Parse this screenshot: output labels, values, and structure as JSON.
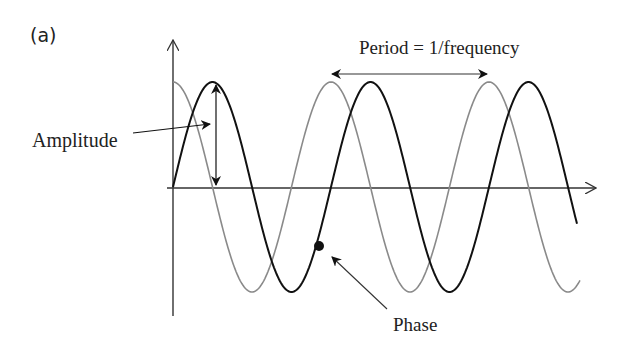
{
  "figure": {
    "panel_label": "(a)",
    "labels": {
      "amplitude": "Amplitude",
      "period": "Period = 1/frequency",
      "phase": "Phase"
    },
    "colors": {
      "wave_primary": "#111111",
      "wave_shifted": "#8a8a8a",
      "axes": "#333333",
      "background": "#ffffff"
    },
    "waves": [
      {
        "name": "primary-wave",
        "shape": "sine",
        "color": "#111111",
        "cycles_shown": 2.55
      },
      {
        "name": "shifted-wave",
        "shape": "cosine (phase-shifted)",
        "color": "#8a8a8a",
        "cycles_shown": 2.58
      }
    ],
    "annotations": [
      {
        "name": "amplitude-arrow",
        "description": "double-headed vertical arrow from axis to peak"
      },
      {
        "name": "period-arrow",
        "description": "double-headed horizontal arrow spanning one cycle of shifted wave"
      },
      {
        "name": "phase-marker",
        "description": "dot on primary wave with arrow pointing from Phase label"
      }
    ]
  }
}
